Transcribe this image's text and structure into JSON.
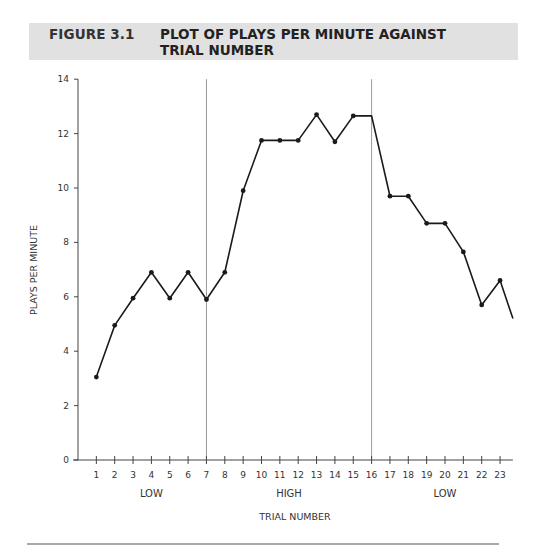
{
  "figure": {
    "number": "FIGURE 3.1",
    "title_line1": "PLOT OF PLAYS PER MINUTE AGAINST",
    "title_line2": "TRIAL NUMBER"
  },
  "colors": {
    "title_band": "#e1e1e1",
    "line": "#1a1a1a",
    "axis": "#444444",
    "divider": "#9a9a9a"
  },
  "chart_data": {
    "type": "line",
    "title": "FIGURE 3.1 PLOT OF PLAYS PER MINUTE AGAINST TRIAL NUMBER",
    "xlabel": "TRIAL NUMBER",
    "ylabel": "PLAYS PER MINUTE",
    "ylim": [
      0,
      14
    ],
    "xlim": [
      0,
      23.7
    ],
    "yticks": [
      0,
      2,
      4,
      6,
      8,
      10,
      12,
      14
    ],
    "xticks": [
      1,
      2,
      3,
      4,
      5,
      6,
      7,
      8,
      9,
      10,
      11,
      12,
      13,
      14,
      15,
      16,
      17,
      18,
      19,
      20,
      21,
      22,
      23
    ],
    "grid": false,
    "legend": null,
    "x": [
      1,
      2,
      3,
      4,
      5,
      6,
      7,
      8,
      9,
      10,
      11,
      12,
      13,
      14,
      15,
      16,
      17,
      18,
      19,
      20,
      21,
      22,
      23,
      23.7
    ],
    "series": [
      {
        "name": "Plays per minute",
        "values": [
          3.05,
          4.95,
          5.95,
          6.9,
          5.95,
          6.9,
          5.9,
          6.9,
          9.9,
          11.75,
          11.75,
          11.75,
          12.7,
          11.7,
          12.65,
          12.65,
          9.7,
          9.7,
          8.7,
          8.7,
          7.65,
          5.7,
          6.6,
          5.2
        ],
        "markers": [
          true,
          true,
          true,
          true,
          true,
          true,
          true,
          true,
          true,
          true,
          true,
          true,
          true,
          true,
          true,
          false,
          true,
          true,
          true,
          true,
          true,
          true,
          true,
          false
        ]
      }
    ],
    "phase_dividers": [
      7,
      16
    ],
    "phases": [
      {
        "label": "LOW",
        "center_trial": 4
      },
      {
        "label": "HIGH",
        "center_trial": 11.5
      },
      {
        "label": "LOW",
        "center_trial": 20
      }
    ]
  }
}
